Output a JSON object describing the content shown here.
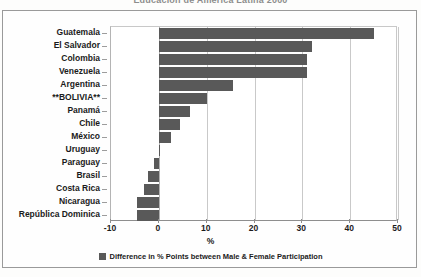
{
  "title": "Educación de América Latina 2000",
  "chart_data": {
    "type": "bar",
    "orientation": "horizontal",
    "title": "Educación de América Latina 2000",
    "xlabel": "%",
    "ylabel": "",
    "xlim": [
      -10,
      50
    ],
    "xticks": [
      "-10",
      "0",
      "10",
      "20",
      "30",
      "40",
      "50"
    ],
    "xtick_values": [
      -10,
      0,
      10,
      20,
      30,
      40,
      50
    ],
    "grid": true,
    "legend_position": "bottom",
    "series_color": "#595959",
    "categories": [
      "Guatemala",
      "El Salvador",
      "Colombia",
      "Venezuela",
      "Argentina",
      "**BOLIVIA**",
      "Panamá",
      "Chile",
      "México",
      "Uruguay",
      "Paraguay",
      "Brasil",
      "Costa Rica",
      "Nicaragua",
      "República Dominica"
    ],
    "series": [
      {
        "name": "Difference in % Points between Male & Female Participation",
        "values": [
          45,
          32,
          31,
          31,
          15.5,
          10,
          6.5,
          4.5,
          2.5,
          0.2,
          -1,
          -2.2,
          -3,
          -4.5,
          -4.5
        ]
      }
    ]
  },
  "legend": {
    "entries": [
      {
        "label": "Difference in % Points between Male & Female Participation",
        "color": "#595959"
      }
    ]
  },
  "axis": {
    "x_title": "%"
  }
}
